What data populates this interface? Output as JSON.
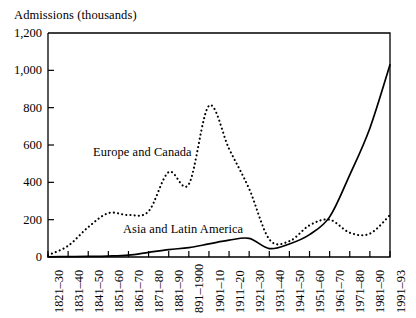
{
  "chart_data": {
    "type": "line",
    "title": "Admissions (thousands)",
    "xlabel": "",
    "ylabel": "Admissions (thousands)",
    "ylim": [
      0,
      1200
    ],
    "yticks": [
      0,
      200,
      400,
      600,
      800,
      1000,
      1200
    ],
    "ytick_labels": [
      "0",
      "200",
      "400",
      "600",
      "800",
      "1,000",
      "1,200"
    ],
    "grid": false,
    "legend_position": "inline-annotation",
    "categories": [
      "1821–30",
      "1831–40",
      "1841–50",
      "1851–60",
      "1861–70",
      "1871–80",
      "1881–90",
      "891–1900",
      "1901–10",
      "1911–20",
      "1921–30",
      "1931–40",
      "1941–50",
      "1951–60",
      "1961–70",
      "1971–80",
      "1981–90",
      "1991–93"
    ],
    "series": [
      {
        "name": "Europe and Canada",
        "style": "dotted",
        "color": "#000000",
        "values": [
          10,
          60,
          160,
          235,
          225,
          245,
          455,
          390,
          810,
          580,
          365,
          95,
          85,
          170,
          200,
          130,
          125,
          225
        ]
      },
      {
        "name": "Asia and Latin America",
        "style": "solid",
        "color": "#000000",
        "values": [
          1,
          2,
          3,
          5,
          10,
          25,
          40,
          50,
          70,
          90,
          100,
          45,
          70,
          120,
          215,
          440,
          690,
          1030
        ]
      }
    ],
    "annotations": [
      {
        "text": "Europe and Canada",
        "series": "Europe and Canada"
      },
      {
        "text": "Asia and Latin America",
        "series": "Asia and Latin America"
      }
    ]
  },
  "layout": {
    "plot_left": 48,
    "plot_right": 390,
    "plot_top": 33,
    "plot_bottom": 257
  }
}
